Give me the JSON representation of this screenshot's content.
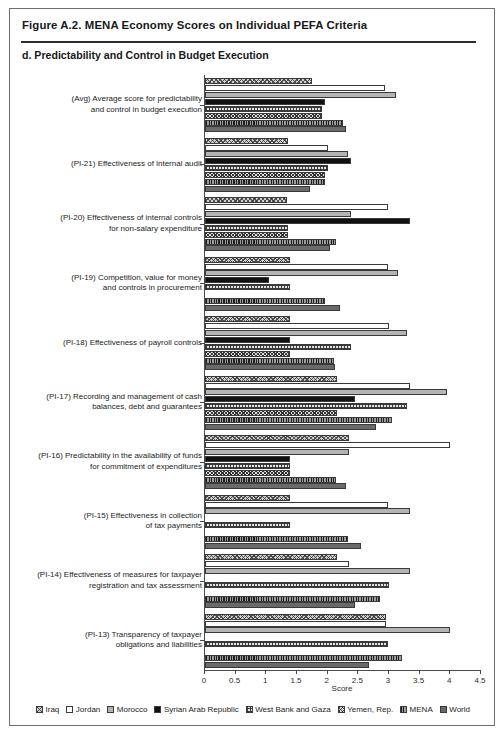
{
  "figure": {
    "title": "Figure A.2. MENA Economy Scores on Individual PEFA Criteria",
    "panel_title": "d. Predictability and Control in Budget Execution"
  },
  "chart_data": {
    "type": "bar",
    "orientation": "horizontal",
    "title": "d. Predictability and Control in Budget Execution",
    "xlabel": "Score",
    "ylabel": "",
    "xlim": [
      0,
      4.5
    ],
    "xticks": [
      "0",
      "0.5",
      "1",
      "1.5",
      "2",
      "2.5",
      "3",
      "3.5",
      "4",
      "4.5"
    ],
    "xtick_values": [
      0,
      0.5,
      1,
      1.5,
      2,
      2.5,
      3,
      3.5,
      4,
      4.5
    ],
    "grid": false,
    "legend_position": "bottom",
    "categories": [
      "(Avg) Average score for predictability and control in budget execution",
      "(PI-21) Effectiveness of internal audit",
      "(PI-20) Effectiveness of internal controls for non-salary expenditure",
      "(PI-19) Competition, value for money and controls in procurement",
      "(PI-18) Effectiveness of payroll controls",
      "(PI-17) Recording and management of cash balances, debt and guarantees",
      "(PI-16) Predictability in the availability of funds for commitment of expenditures",
      "(PI-15) Effectiveness in collection of tax payments",
      "(PI-14) Effectiveness of measures for taxpayer registration and tax assessment",
      "(PI-13) Transparency of taxpayer obligations and liabilities"
    ],
    "category_lines": [
      [
        "(Avg) Average score for predictability",
        "and control in budget execution"
      ],
      [
        "(PI-21) Effectiveness of internal audit"
      ],
      [
        "(PI-20) Effectiveness of internal controls",
        "for non-salary expenditure"
      ],
      [
        "(PI-19) Competition, value for money",
        "and controls in procurement"
      ],
      [
        "(PI-18) Effectiveness of payroll controls"
      ],
      [
        "(PI-17) Recording and management of cash",
        "balances, debt and guarantees"
      ],
      [
        "(PI-16) Predictability in the availability of funds",
        "for commitment of expenditures"
      ],
      [
        "(PI-15) Effectiveness in collection",
        "of tax payments"
      ],
      [
        "(PI-14) Effectiveness of measures for taxpayer",
        "registration and tax assessment"
      ],
      [
        "(PI-13) Transparency of taxpayer",
        "obligations and liabilities"
      ]
    ],
    "series": [
      {
        "name": "Iraq",
        "key": "iraq",
        "values": [
          1.75,
          1.35,
          1.33,
          1.38,
          1.38,
          2.15,
          2.35,
          1.38,
          2.15,
          2.95
        ]
      },
      {
        "name": "Jordan",
        "key": "jordan",
        "values": [
          2.93,
          2.0,
          2.98,
          2.98,
          3.0,
          3.35,
          4.0,
          2.98,
          2.35,
          2.95
        ]
      },
      {
        "name": "Morocco",
        "key": "morocco",
        "values": [
          3.12,
          2.33,
          2.38,
          3.15,
          3.3,
          3.95,
          2.35,
          3.35,
          3.35,
          4.0
        ]
      },
      {
        "name": "Syrian Arab Republic",
        "key": "syria",
        "values": [
          1.95,
          2.38,
          3.35,
          1.05,
          1.38,
          2.45,
          1.38,
          0,
          0,
          0
        ]
      },
      {
        "name": "West Bank and Gaza",
        "key": "wbg",
        "values": [
          1.9,
          2.0,
          1.35,
          1.38,
          2.38,
          3.3,
          1.38,
          1.38,
          3.0,
          2.98
        ]
      },
      {
        "name": "Yemen, Rep.",
        "key": "yemen",
        "values": [
          1.9,
          1.95,
          1.35,
          0,
          1.38,
          2.15,
          1.38,
          0,
          0,
          0
        ]
      },
      {
        "name": "MENA",
        "key": "mena",
        "values": [
          2.25,
          1.95,
          2.13,
          1.95,
          2.1,
          3.05,
          2.13,
          2.33,
          2.85,
          3.22
        ]
      },
      {
        "name": "World",
        "key": "world",
        "values": [
          2.3,
          1.72,
          2.03,
          2.2,
          2.12,
          2.78,
          2.3,
          2.55,
          2.45,
          2.68
        ]
      }
    ]
  },
  "legend": {
    "items": [
      {
        "label": "Iraq",
        "key": "iraq"
      },
      {
        "label": "Jordan",
        "key": "jordan"
      },
      {
        "label": "Morocco",
        "key": "morocco"
      },
      {
        "label": "Syrian Arab Republic",
        "key": "syria"
      },
      {
        "label": "West Bank and Gaza",
        "key": "wbg"
      },
      {
        "label": "Yemen, Rep.",
        "key": "yemen"
      },
      {
        "label": "MENA",
        "key": "mena"
      },
      {
        "label": "World",
        "key": "world"
      }
    ]
  },
  "axis": {
    "x_title": "Score"
  }
}
